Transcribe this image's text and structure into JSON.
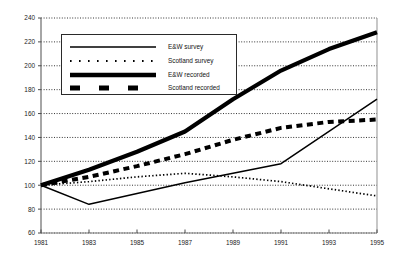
{
  "chart_data": {
    "type": "line",
    "title": "",
    "subtitle": "",
    "xlabel": "",
    "ylabel": "",
    "xlim": [
      1981,
      1995
    ],
    "ylim": [
      60,
      240
    ],
    "ytick_step": 20,
    "grid": "horizontal-dotted",
    "legend_position": "upper-left-inside",
    "x": [
      1981,
      1983,
      1985,
      1987,
      1989,
      1991,
      1993,
      1995
    ],
    "xtick_labels": [
      "1981",
      "1983",
      "1985",
      "1987",
      "1989",
      "1991",
      "1993",
      "1995"
    ],
    "ytick_labels": [
      "60",
      "80",
      "100",
      "120",
      "140",
      "160",
      "180",
      "200",
      "220",
      "240"
    ],
    "series": [
      {
        "name": "E&W survey",
        "style": "thin-solid",
        "color": "#000000",
        "values": [
          100,
          84,
          93,
          102,
          110,
          118,
          145,
          172
        ]
      },
      {
        "name": "Scotland survey",
        "style": "fine-dotted",
        "color": "#000000",
        "values": [
          100,
          103,
          107,
          110,
          107,
          103,
          97,
          91
        ]
      },
      {
        "name": "E&W recorded",
        "style": "thick-solid",
        "color": "#000000",
        "values": [
          100,
          113,
          128,
          145,
          172,
          196,
          214,
          228
        ]
      },
      {
        "name": "Scotland recorded",
        "style": "thick-dashed",
        "color": "#000000",
        "values": [
          100,
          107,
          116,
          126,
          138,
          148,
          153,
          155
        ]
      }
    ]
  },
  "legend": {
    "entries": [
      {
        "label": "E&W survey",
        "swatch": "thin-solid-swatch"
      },
      {
        "label": "Scotland survey",
        "swatch": "fine-dotted-swatch"
      },
      {
        "label": "E&W recorded",
        "swatch": "thick-solid-swatch"
      },
      {
        "label": "Scotland recorded",
        "swatch": "thick-dashed-swatch"
      }
    ]
  }
}
